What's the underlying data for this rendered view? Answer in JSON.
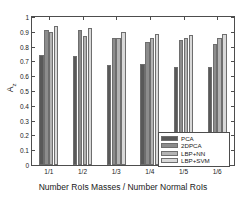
{
  "chart_data": {
    "type": "bar",
    "title": "",
    "xlabel": "Number RoIs Masses / Number Normal RoIs",
    "ylabel": "Az",
    "ylabel_base": "A",
    "ylabel_sub": "z",
    "categories": [
      "1/1",
      "1/2",
      "1/3",
      "1/4",
      "1/5",
      "1/6"
    ],
    "ylim": [
      0,
      1
    ],
    "yticks": [
      0,
      0.1,
      0.2,
      0.3,
      0.4,
      0.5,
      0.6,
      0.7,
      0.8,
      0.9,
      1
    ],
    "ytick_labels": [
      "0",
      "0.1",
      "0.2",
      "0.3",
      "0.4",
      "0.5",
      "0.6",
      "0.7",
      "0.8",
      "0.9",
      "1"
    ],
    "grid": false,
    "legend_position": "lower right",
    "series": [
      {
        "name": "PCA",
        "color": "#595959",
        "values": [
          0.745,
          0.735,
          0.675,
          0.68,
          0.66,
          0.665
        ]
      },
      {
        "name": "2DPCA",
        "color": "#8c8c8c",
        "values": [
          0.91,
          0.91,
          0.855,
          0.83,
          0.845,
          0.82
        ]
      },
      {
        "name": "LBP+NN",
        "color": "#b3b3b3",
        "values": [
          0.9,
          0.87,
          0.855,
          0.86,
          0.855,
          0.86
        ]
      },
      {
        "name": "LBP+SVM",
        "color": "#d9d9d9",
        "values": [
          0.94,
          0.925,
          0.9,
          0.885,
          0.88,
          0.885
        ]
      }
    ]
  },
  "axes": {
    "frame_color": "#4d4d4d",
    "text_color": "#1a1a1a"
  }
}
